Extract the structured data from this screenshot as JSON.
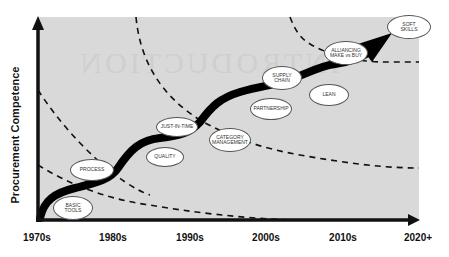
{
  "diagram": {
    "watermark": "INTRODUCTION",
    "y_axis_label": "Procurement Competence",
    "x_axis_ticks": [
      {
        "label": "1970s",
        "x": 37
      },
      {
        "label": "1980s",
        "x": 113
      },
      {
        "label": "1990s",
        "x": 190
      },
      {
        "label": "2000s",
        "x": 266
      },
      {
        "label": "2010s",
        "x": 343
      },
      {
        "label": "2020+",
        "x": 418
      }
    ],
    "stages": [
      {
        "label": "BASIC\nTOOLS",
        "x": 73,
        "y": 208,
        "w": 40,
        "h": 24
      },
      {
        "label": "PROCESS",
        "x": 92,
        "y": 170,
        "w": 44,
        "h": 22
      },
      {
        "label": "QUALITY",
        "x": 165,
        "y": 157,
        "w": 38,
        "h": 20
      },
      {
        "label": "JUST-IN-TIME",
        "x": 177,
        "y": 127,
        "w": 42,
        "h": 20
      },
      {
        "label": "CATEGORY\nMANAGEMENT",
        "x": 230,
        "y": 140,
        "w": 42,
        "h": 24
      },
      {
        "label": "PARTNERSHIP",
        "x": 271,
        "y": 109,
        "w": 42,
        "h": 22
      },
      {
        "label": "SUPPLY\nCHAIN",
        "x": 282,
        "y": 78,
        "w": 40,
        "h": 24
      },
      {
        "label": "LEAN",
        "x": 329,
        "y": 95,
        "w": 40,
        "h": 22
      },
      {
        "label": "ALLIANCING\nMAKE vs BUY",
        "x": 346,
        "y": 53,
        "w": 44,
        "h": 24
      },
      {
        "label": "SOFT\nSKILLS",
        "x": 409,
        "y": 27,
        "w": 44,
        "h": 24
      }
    ],
    "colors": {
      "plot_background": "#d9d9d9",
      "axis": "#111111",
      "curve": "#000000",
      "bubble_fill": "#ffffff",
      "dashed": "#111111"
    }
  }
}
